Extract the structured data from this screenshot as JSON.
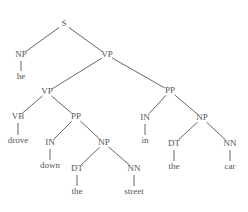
{
  "diagram": {
    "type": "constituency-parse-tree",
    "sentence": "he drove down the street in the car",
    "colors": {
      "text": "#555555",
      "line": "#555555",
      "background": "#ffffff"
    },
    "nodes": [
      {
        "id": "S",
        "label": "S",
        "x": 64,
        "y": 24
      },
      {
        "id": "NP1",
        "label": "NP",
        "x": 21,
        "y": 55
      },
      {
        "id": "he",
        "label": "he",
        "x": 21,
        "y": 77
      },
      {
        "id": "VP1",
        "label": "VP",
        "x": 107,
        "y": 55
      },
      {
        "id": "VP2",
        "label": "VP",
        "x": 47,
        "y": 92
      },
      {
        "id": "VB",
        "label": "VB",
        "x": 18,
        "y": 117
      },
      {
        "id": "drove",
        "label": "drove",
        "x": 18,
        "y": 141
      },
      {
        "id": "PP1",
        "label": "PP",
        "x": 76,
        "y": 117
      },
      {
        "id": "IN1",
        "label": "IN",
        "x": 50,
        "y": 143
      },
      {
        "id": "down",
        "label": "down",
        "x": 50,
        "y": 166
      },
      {
        "id": "NP2",
        "label": "NP",
        "x": 104,
        "y": 143
      },
      {
        "id": "DT1",
        "label": "DT",
        "x": 77,
        "y": 169
      },
      {
        "id": "the1",
        "label": "the",
        "x": 77,
        "y": 192
      },
      {
        "id": "NN1",
        "label": "NN",
        "x": 134,
        "y": 169
      },
      {
        "id": "street",
        "label": "street",
        "x": 134,
        "y": 192
      },
      {
        "id": "PP2",
        "label": "PP",
        "x": 170,
        "y": 91
      },
      {
        "id": "IN2",
        "label": "IN",
        "x": 145,
        "y": 118
      },
      {
        "id": "in",
        "label": "in",
        "x": 145,
        "y": 141
      },
      {
        "id": "NP3",
        "label": "NP",
        "x": 202,
        "y": 118
      },
      {
        "id": "DT2",
        "label": "DT",
        "x": 174,
        "y": 144
      },
      {
        "id": "the2",
        "label": "the",
        "x": 174,
        "y": 167
      },
      {
        "id": "NN2",
        "label": "NN",
        "x": 230,
        "y": 144
      },
      {
        "id": "car",
        "label": "car",
        "x": 230,
        "y": 167
      }
    ],
    "edges": [
      [
        "S",
        "NP1"
      ],
      [
        "S",
        "VP1"
      ],
      [
        "NP1",
        "he"
      ],
      [
        "VP1",
        "VP2"
      ],
      [
        "VP1",
        "PP2"
      ],
      [
        "VP2",
        "VB"
      ],
      [
        "VP2",
        "PP1"
      ],
      [
        "VB",
        "drove"
      ],
      [
        "PP1",
        "IN1"
      ],
      [
        "PP1",
        "NP2"
      ],
      [
        "IN1",
        "down"
      ],
      [
        "NP2",
        "DT1"
      ],
      [
        "NP2",
        "NN1"
      ],
      [
        "DT1",
        "the1"
      ],
      [
        "NN1",
        "street"
      ],
      [
        "PP2",
        "IN2"
      ],
      [
        "PP2",
        "NP3"
      ],
      [
        "IN2",
        "in"
      ],
      [
        "NP3",
        "DT2"
      ],
      [
        "NP3",
        "NN2"
      ],
      [
        "DT2",
        "the2"
      ],
      [
        "NN2",
        "car"
      ]
    ]
  }
}
